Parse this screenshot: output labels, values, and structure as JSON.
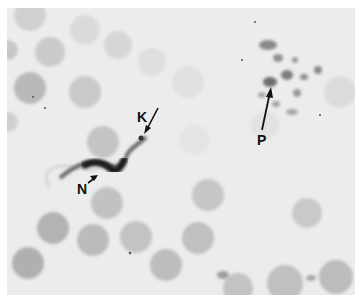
{
  "figure": {
    "labels": [
      {
        "id": "K",
        "text": "K",
        "meaning": "kinetoplast"
      },
      {
        "id": "N",
        "text": "N",
        "meaning": "nucleus"
      },
      {
        "id": "P",
        "text": "P",
        "meaning": "platelets"
      }
    ],
    "colors": {
      "background": "#ececec",
      "cell": "#b8b8b8",
      "organism": "#222222",
      "label": "#111111"
    }
  }
}
